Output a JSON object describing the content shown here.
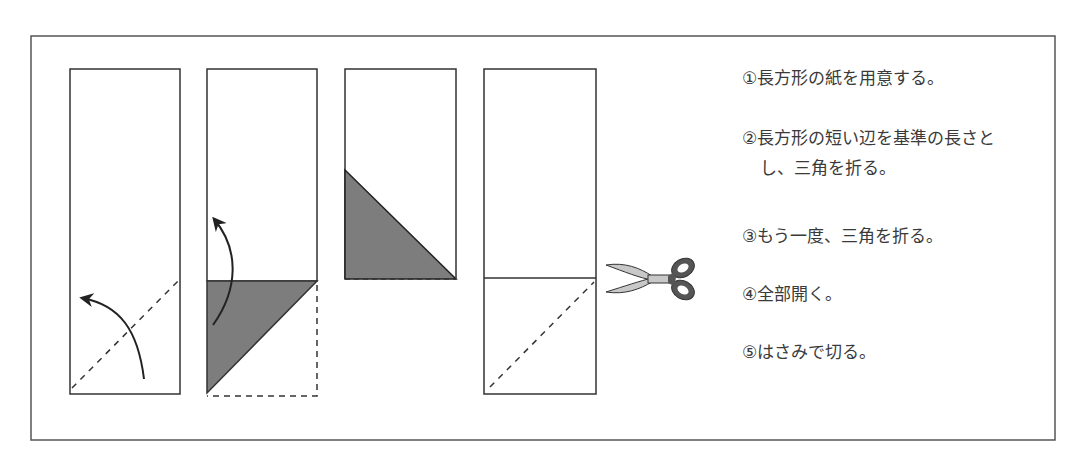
{
  "figure": {
    "type": "origami-instruction-diagram",
    "panels": [
      {
        "id": 1,
        "description": "rectangle with dashed diagonal fold line at bottom and curved arrow"
      },
      {
        "id": 2,
        "description": "triangle folded (shaded) at bottom with curved arrow upward"
      },
      {
        "id": 3,
        "description": "folded again, shaded triangle, dashed bottom edge"
      },
      {
        "id": 4,
        "description": "unfolded rectangle with crease line and dashed diagonal, scissors"
      }
    ],
    "colors": {
      "line": "#333333",
      "shade": "#7a7a7a",
      "scissors_handle": "#555555",
      "scissors_blade": "#cccccc"
    }
  },
  "steps": {
    "s1": "①長方形の紙を用意する。",
    "s2a": "②長方形の短い辺を基準の長さと",
    "s2b": "し、三角を折る。",
    "s3": "③もう一度、三角を折る。",
    "s4": "④全部開く。",
    "s5": "⑤はさみで切る。"
  }
}
